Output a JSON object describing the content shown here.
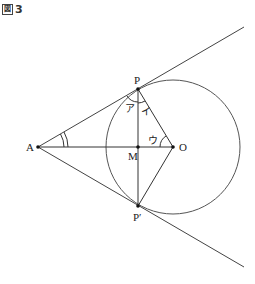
{
  "figure": {
    "label_box": "図",
    "label_number": "3"
  },
  "points": {
    "P": "P",
    "P_prime": "P′",
    "A": "A",
    "M": "M",
    "O": "O"
  },
  "angles": {
    "a": "ア",
    "i": "イ",
    "u": "ウ"
  },
  "colors": {
    "line": "#333333",
    "circle": "#555555"
  }
}
